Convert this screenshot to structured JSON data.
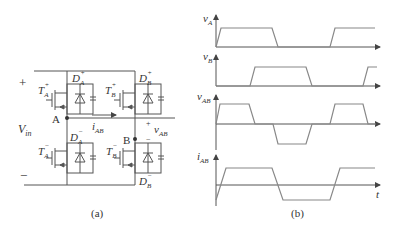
{
  "figure": {
    "type": "full-bridge converter circuit and switching waveforms",
    "colors": {
      "line": "#555555",
      "wave": "#888888",
      "text": "#333333",
      "background": "#ffffff"
    }
  },
  "circuit": {
    "caption": "(a)",
    "supply": {
      "label": "V",
      "sub": "in",
      "plus": "+",
      "minus": "−"
    },
    "nodes": [
      {
        "label": "A"
      },
      {
        "label": "B"
      }
    ],
    "switches": [
      {
        "id": "TA+",
        "label": "T",
        "sub": "A",
        "sup": "+"
      },
      {
        "id": "TB+",
        "label": "T",
        "sub": "B",
        "sup": "+"
      },
      {
        "id": "TA-",
        "label": "T",
        "sub": "A",
        "sup": "−"
      },
      {
        "id": "TB-",
        "label": "T",
        "sub": "B",
        "sup": "−"
      }
    ],
    "diodes": [
      {
        "id": "DA+",
        "label": "D",
        "sub": "A",
        "sup": "+"
      },
      {
        "id": "DB+",
        "label": "D",
        "sub": "B",
        "sup": "+"
      },
      {
        "id": "DA-",
        "label": "D",
        "sub": "A",
        "sup": "−"
      },
      {
        "id": "DB-",
        "label": "D",
        "sub": "B",
        "sup": "−"
      }
    ],
    "current": {
      "label": "i",
      "sub": "AB"
    },
    "voltage": {
      "label": "v",
      "sub": "AB",
      "plus": "+",
      "minus": "−"
    }
  },
  "waveforms": {
    "caption": "(b)",
    "time_label": "t",
    "traces": [
      {
        "label": "v",
        "sub": "A"
      },
      {
        "label": "v",
        "sub": "B"
      },
      {
        "label": "v",
        "sub": "AB"
      },
      {
        "label": "i",
        "sub": "AB"
      }
    ]
  }
}
